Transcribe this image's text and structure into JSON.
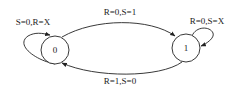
{
  "diagram": {
    "type": "state-transition",
    "states": [
      {
        "id": "s0",
        "label": "0"
      },
      {
        "id": "s1",
        "label": "1"
      }
    ],
    "transitions": [
      {
        "from": "0",
        "to": "1",
        "label": "R=0,S=1"
      },
      {
        "from": "1",
        "to": "0",
        "label": "R=1,S=0"
      },
      {
        "from": "0",
        "to": "0",
        "label": "S=0,R=X"
      },
      {
        "from": "1",
        "to": "1",
        "label": "R=0,S=X"
      }
    ]
  }
}
